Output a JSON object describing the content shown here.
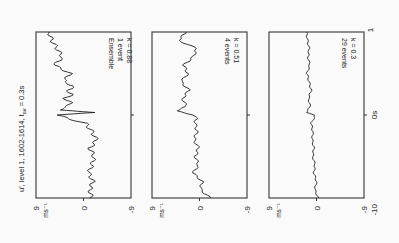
{
  "figure": {
    "title_main": "u', level 1, 1602-1614, t",
    "title_sub": "av",
    "title_tail": " = 0.3s",
    "rotation_deg": 90,
    "time_axis": {
      "labels": [
        "-10",
        "0s",
        "1"
      ]
    },
    "value_axis": {
      "labels": [
        "9",
        "0",
        "-9"
      ],
      "unit": "ms",
      "unit_exp": "-1"
    }
  },
  "chart_data": [
    {
      "type": "line",
      "title": "Ensemble 1 event",
      "annotation_lines": [
        "Ensemble",
        "1 event",
        "k = 0.88"
      ],
      "xlabel": "time (s)",
      "ylabel": "u' (ms^-1)",
      "xlim": [
        -10,
        10
      ],
      "ylim": [
        -9,
        9
      ],
      "x": [
        -10,
        -9,
        -8,
        -7,
        -6,
        -5,
        -4,
        -3,
        -2,
        -1.5,
        -1,
        -0.5,
        0,
        0.3,
        0.6,
        1,
        1.5,
        2,
        2.5,
        3,
        3.5,
        4,
        5,
        6,
        7,
        8,
        9,
        10
      ],
      "values": [
        -1.5,
        -1.2,
        -1.8,
        -1.0,
        -1.6,
        -2.0,
        -1.2,
        -2.5,
        -1.6,
        -1.0,
        -0.4,
        2.5,
        5.0,
        -2.5,
        4.8,
        3.0,
        2.5,
        3.5,
        2.2,
        3.0,
        1.8,
        3.8,
        2.5,
        5.5,
        4.0,
        5.0,
        6.0,
        6.5
      ]
    },
    {
      "type": "line",
      "title": "4 events",
      "annotation_lines": [
        "4 events",
        "k = 0.51"
      ],
      "xlabel": "time (s)",
      "ylabel": "u' (ms^-1)",
      "xlim": [
        -10,
        10
      ],
      "ylim": [
        -9,
        9
      ],
      "x": [
        -10,
        -9,
        -8,
        -7,
        -6,
        -5,
        -4,
        -3,
        -2,
        -1,
        -0.5,
        0,
        0.5,
        1,
        2,
        3,
        4,
        5,
        6,
        7,
        8,
        9,
        10
      ],
      "values": [
        -2.0,
        -0.2,
        -0.5,
        1.2,
        0.2,
        0.8,
        0.2,
        1.0,
        0.5,
        0.8,
        0.6,
        1.0,
        4.5,
        2.5,
        3.2,
        2.0,
        3.5,
        2.2,
        3.0,
        1.2,
        0.5,
        4.0,
        2.5
      ]
    },
    {
      "type": "line",
      "title": "29 events",
      "annotation_lines": [
        "29 events",
        "k = 0.3"
      ],
      "xlabel": "time (s)",
      "ylabel": "u' (ms^-1)",
      "xlim": [
        -10,
        10
      ],
      "ylim": [
        -9,
        9
      ],
      "x": [
        -10,
        -9,
        -8,
        -7,
        -6,
        -5,
        -4,
        -3,
        -2,
        -1,
        -0.5,
        0,
        0.3,
        1,
        2,
        3,
        4,
        5,
        6,
        7,
        8,
        9,
        10
      ],
      "values": [
        -0.3,
        0.3,
        0.0,
        0.5,
        0.3,
        0.7,
        0.5,
        0.8,
        0.7,
        1.0,
        0.6,
        0.2,
        2.0,
        1.2,
        1.5,
        1.0,
        1.4,
        1.8,
        1.3,
        1.6,
        1.4,
        1.7,
        1.9
      ]
    }
  ]
}
